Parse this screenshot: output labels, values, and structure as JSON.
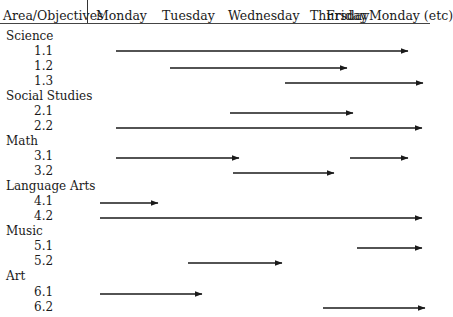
{
  "header": {
    "first_column": "Area/Objectives",
    "days": [
      "Monday",
      "Tuesday",
      "Wednesday",
      "Thursday",
      "Friday",
      "Monday (etc)"
    ]
  },
  "areas": [
    {
      "name": "Science",
      "objectives": [
        {
          "id": "1.1",
          "bars": [
            {
              "from": "Monday",
              "to": "Monday (etc)"
            }
          ]
        },
        {
          "id": "1.2",
          "bars": [
            {
              "from": "Tuesday",
              "to": "Friday"
            }
          ]
        },
        {
          "id": "1.3",
          "bars": [
            {
              "from": "Thursday",
              "to": "Monday (etc)"
            }
          ]
        }
      ]
    },
    {
      "name": "Social Studies",
      "objectives": [
        {
          "id": "2.1",
          "bars": [
            {
              "from": "Wednesday",
              "to": "Friday"
            }
          ]
        },
        {
          "id": "2.2",
          "bars": [
            {
              "from": "Monday",
              "to": "Monday (etc)"
            }
          ]
        }
      ]
    },
    {
      "name": "Math",
      "objectives": [
        {
          "id": "3.1",
          "bars": [
            {
              "from": "Monday",
              "to": "Wednesday"
            },
            {
              "from": "Friday",
              "to": "Monday (etc)"
            }
          ]
        },
        {
          "id": "3.2",
          "bars": [
            {
              "from": "Wednesday",
              "to": "Thursday"
            }
          ]
        }
      ]
    },
    {
      "name": "Language Arts",
      "objectives": [
        {
          "id": "4.1",
          "bars": [
            {
              "from": "Monday",
              "to": "Tuesday"
            }
          ]
        },
        {
          "id": "4.2",
          "bars": [
            {
              "from": "Monday",
              "to": "Monday (etc)"
            }
          ]
        }
      ]
    },
    {
      "name": "Music",
      "objectives": [
        {
          "id": "5.1",
          "bars": [
            {
              "from": "Friday",
              "to": "Monday (etc)"
            }
          ]
        },
        {
          "id": "5.2",
          "bars": [
            {
              "from": "Tuesday",
              "to": "Thursday"
            }
          ]
        }
      ]
    },
    {
      "name": "Art",
      "objectives": [
        {
          "id": "6.1",
          "bars": [
            {
              "from": "Monday",
              "to": "Tuesday"
            }
          ]
        },
        {
          "id": "6.2",
          "bars": [
            {
              "from": "Thursday",
              "to": "Monday (etc)"
            }
          ]
        }
      ]
    }
  ],
  "arrows": [
    {
      "objective": "1.1",
      "x1": 116,
      "x2": 408,
      "y": 51
    },
    {
      "objective": "1.2",
      "x1": 170,
      "x2": 347,
      "y": 68
    },
    {
      "objective": "1.3",
      "x1": 285,
      "x2": 423,
      "y": 83
    },
    {
      "objective": "2.1",
      "x1": 230,
      "x2": 353,
      "y": 113
    },
    {
      "objective": "2.2",
      "x1": 116,
      "x2": 422,
      "y": 128
    },
    {
      "objective": "3.1",
      "x1": 116,
      "x2": 239,
      "y": 158
    },
    {
      "objective": "3.1",
      "x1": 350,
      "x2": 408,
      "y": 158
    },
    {
      "objective": "3.2",
      "x1": 233,
      "x2": 334,
      "y": 173
    },
    {
      "objective": "4.1",
      "x1": 100,
      "x2": 158,
      "y": 203
    },
    {
      "objective": "4.2",
      "x1": 100,
      "x2": 422,
      "y": 218
    },
    {
      "objective": "5.1",
      "x1": 357,
      "x2": 422,
      "y": 248
    },
    {
      "objective": "5.2",
      "x1": 188,
      "x2": 282,
      "y": 263
    },
    {
      "objective": "6.1",
      "x1": 100,
      "x2": 202,
      "y": 294
    },
    {
      "objective": "6.2",
      "x1": 323,
      "x2": 425,
      "y": 308
    }
  ],
  "colors": {
    "line": "#1a1a1a",
    "text": "#1a1a1a",
    "background": "#ffffff"
  }
}
